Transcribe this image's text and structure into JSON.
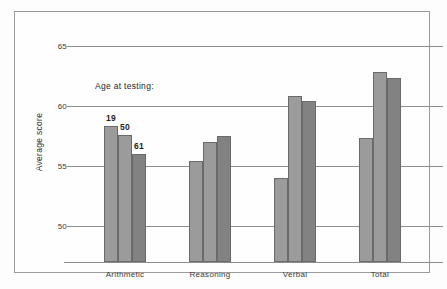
{
  "chart_data": {
    "type": "bar",
    "title": "",
    "xlabel": "",
    "ylabel": "Average score",
    "legend_title": "Age at testing:",
    "legend_position": "inside-top-left",
    "grid": true,
    "ylim": [
      47,
      65
    ],
    "yticks": [
      50,
      55,
      60,
      65
    ],
    "ytick_labels": [
      "50",
      "55",
      "60",
      "65"
    ],
    "categories": [
      "Arithmetic",
      "Reasoning",
      "Verbal",
      "Total"
    ],
    "series": [
      {
        "name": "19",
        "label": "19",
        "color": "#9b9b9b",
        "values": [
          58.3,
          55.4,
          54.0,
          57.3
        ]
      },
      {
        "name": "50",
        "label": "50",
        "color": "#9b9b9b",
        "values": [
          57.6,
          57.0,
          60.8,
          62.8
        ]
      },
      {
        "name": "61",
        "label": "61",
        "color": "#828282",
        "values": [
          56.0,
          57.5,
          60.4,
          62.3
        ]
      }
    ],
    "value_labels_shown_on": "Arithmetic",
    "value_labels": [
      "19",
      "50",
      "61"
    ]
  },
  "figure": {
    "background": "#fdfdfd",
    "frame_color": "#9b9b9b",
    "axis_color": "#8d8d8d",
    "text_color": "#2e2e2e"
  }
}
